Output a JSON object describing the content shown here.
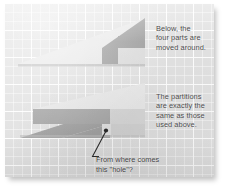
{
  "figure": {
    "background_color": "#e2e2e2",
    "grid_line_color": "#ffffff"
  },
  "notes": [
    {
      "id": "note-top",
      "text": "Below, the\nfour parts are\nmoved around."
    },
    {
      "id": "note-bottom",
      "text": "The partitions\nare exactly the\nsame as those\nused above."
    }
  ],
  "callout": {
    "text": "From where comes\nthis \"hole\"?",
    "line_color": "#2b2b2b"
  },
  "colors": {
    "dark_gray": "#9a9a9a",
    "mid_gray": "#c3c3c3",
    "light_gray": "#dcdcdc",
    "pale_gray": "#eaeaea",
    "text": "#4a4a4a"
  },
  "top_figure": {
    "label": "Original triangle arrangement",
    "parts": [
      {
        "name": "light-slope-wedge",
        "fill": "#e8e8e8"
      },
      {
        "name": "dark-upper-triangle",
        "fill": "#9d9d9d"
      },
      {
        "name": "dark-step-block",
        "fill": "#9d9d9d"
      },
      {
        "name": "pale-notch-block",
        "fill": "#dddddd"
      }
    ]
  },
  "bottom_figure": {
    "label": "Rearranged triangle with hole",
    "parts": [
      {
        "name": "pale-upper-slope",
        "fill": "#e8e8e8"
      },
      {
        "name": "dark-lower-triangle",
        "fill": "#a3a3a3"
      },
      {
        "name": "mid-bar-block",
        "fill": "#c9c9c9"
      },
      {
        "name": "light-right-block",
        "fill": "#dcdcdc"
      },
      {
        "name": "hole-gap",
        "fill": "#e2e2e2"
      }
    ]
  }
}
